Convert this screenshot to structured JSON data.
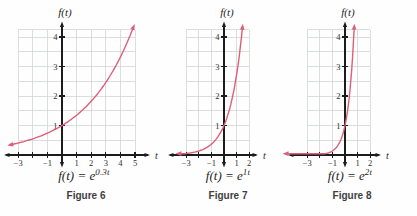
{
  "colors": {
    "curve": "#dd5f78",
    "axis": "#1c1c1c",
    "grid": "#cfd4d0",
    "tick_label": "#2e2e2e",
    "formula": "#1f1f1f",
    "caption": "#3e3e3e",
    "background": "#fefefe"
  },
  "chart_data": [
    {
      "type": "line",
      "name": "figure-6",
      "title": "Figure 6",
      "formula_base": "f(t) = e",
      "formula_exponent": "0.3t",
      "function": "f(t) = e^(0.3t)",
      "growth_rate_k": 0.3,
      "x_axis_label": "t",
      "y_axis_label": "f(t)",
      "xlim": [
        -3,
        5
      ],
      "ylim": [
        0,
        4.25
      ],
      "grid": true,
      "x_tick_marks": [
        -3,
        -2,
        -1,
        1,
        2,
        3,
        4,
        5
      ],
      "x_tick_labels": [
        {
          "t": -3,
          "label": "−3"
        },
        {
          "t": -1,
          "label": "−1"
        },
        {
          "t": 1,
          "label": "1"
        },
        {
          "t": 2,
          "label": "2"
        },
        {
          "t": 3,
          "label": "3"
        },
        {
          "t": 4,
          "label": "4"
        },
        {
          "t": 5,
          "label": "5"
        }
      ],
      "y_tick_labels": [
        {
          "y": 1,
          "label": "1"
        },
        {
          "y": 2,
          "label": "2"
        },
        {
          "y": 3,
          "label": "3"
        },
        {
          "y": 4,
          "label": "4"
        }
      ],
      "curve_points": [
        [
          -3,
          0.41
        ],
        [
          -2,
          0.55
        ],
        [
          -1,
          0.74
        ],
        [
          0,
          1
        ],
        [
          1,
          1.35
        ],
        [
          2,
          1.82
        ],
        [
          3,
          2.46
        ],
        [
          4,
          3.32
        ],
        [
          5,
          4.48
        ]
      ]
    },
    {
      "type": "line",
      "name": "figure-7",
      "title": "Figure 7",
      "formula_base": "f(t) = e",
      "formula_exponent": "1t",
      "function": "f(t) = e^(1t)",
      "growth_rate_k": 1,
      "x_axis_label": "t",
      "y_axis_label": "f(t)",
      "xlim": [
        -3,
        2
      ],
      "ylim": [
        0,
        4.25
      ],
      "grid": true,
      "x_tick_marks": [
        -3,
        -2,
        -1,
        1,
        2
      ],
      "x_tick_labels": [
        {
          "t": -3,
          "label": "−3"
        },
        {
          "t": -1,
          "label": "−1"
        },
        {
          "t": 1,
          "label": "1"
        },
        {
          "t": 2,
          "label": "2"
        }
      ],
      "y_tick_labels": [
        {
          "y": 1,
          "label": "1"
        },
        {
          "y": 2,
          "label": "2"
        },
        {
          "y": 3,
          "label": "3"
        },
        {
          "y": 4,
          "label": "4"
        }
      ],
      "curve_points": [
        [
          -3,
          0.05
        ],
        [
          -2,
          0.14
        ],
        [
          -1,
          0.37
        ],
        [
          0,
          1
        ],
        [
          1,
          2.72
        ],
        [
          1.46,
          4.3
        ]
      ]
    },
    {
      "type": "line",
      "name": "figure-8",
      "title": "Figure 8",
      "formula_base": "f(t) = e",
      "formula_exponent": "2t",
      "function": "f(t) = e^(2t)",
      "growth_rate_k": 2,
      "x_axis_label": "t",
      "y_axis_label": "f(t)",
      "xlim": [
        -3,
        2
      ],
      "ylim": [
        0,
        4.25
      ],
      "grid": true,
      "x_tick_marks": [
        -3,
        -2,
        -1,
        1,
        2
      ],
      "x_tick_labels": [
        {
          "t": -3,
          "label": "−3"
        },
        {
          "t": -1,
          "label": "−1"
        },
        {
          "t": 1,
          "label": "1"
        },
        {
          "t": 2,
          "label": "2"
        }
      ],
      "y_tick_labels": [
        {
          "y": 1,
          "label": "1"
        },
        {
          "y": 2,
          "label": "2"
        },
        {
          "y": 3,
          "label": "3"
        },
        {
          "y": 4,
          "label": "4"
        }
      ],
      "curve_points": [
        [
          -3,
          0.002
        ],
        [
          -2,
          0.018
        ],
        [
          -1,
          0.14
        ],
        [
          0,
          1
        ],
        [
          0.5,
          2.72
        ],
        [
          0.73,
          4.3
        ]
      ]
    }
  ]
}
